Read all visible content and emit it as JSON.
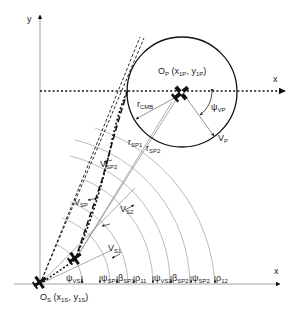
{
  "colors": {
    "background": "#ffffff",
    "axis": "#999999",
    "ink": "#111111",
    "thin_line": "#777777",
    "arc": "#aaaaaa"
  },
  "axes": {
    "y_label": "y",
    "x_label_bottom": "x",
    "x_label_top": "x"
  },
  "origin_S": {
    "main": "O",
    "main_sub": "S",
    "coords_open": " (x",
    "x_sub": "1S",
    "comma": ", y",
    "y_sub": "1S",
    "close": ")"
  },
  "origin_P": {
    "main": "O",
    "main_sub": "P",
    "coords_open": " (x",
    "x_sub": "1P",
    "comma": ", y",
    "y_sub": "1P",
    "close": ")"
  },
  "labels": {
    "r_cmb": {
      "main": "r",
      "sub": "CMB"
    },
    "r_sp1": {
      "main": "r",
      "sub": "SP1"
    },
    "r_sp2": {
      "main": "r",
      "sub": "SP2"
    },
    "psi_vp": {
      "main": "ψ",
      "sub": "VP"
    },
    "v_p": {
      "main": "V",
      "sub": "P"
    },
    "v_sp2": {
      "main": "V",
      "sub": "SP2"
    },
    "v_sp": {
      "main": "V",
      "sub": "SP"
    },
    "v_s2": {
      "main": "V",
      "sub": "S2"
    },
    "v_s1": {
      "main": "V",
      "sub": "S1"
    }
  },
  "angle_labels": [
    {
      "main": "ψ",
      "sub": "VS1"
    },
    {
      "main": "ψ",
      "sub": "SP1"
    },
    {
      "main": "β",
      "sub": "SP1"
    },
    {
      "main": "ρ",
      "sub": "11"
    },
    {
      "main": "ψ",
      "sub": "VS2"
    },
    {
      "main": "β",
      "sub": "SP2"
    },
    {
      "main": "ψ",
      "sub": "SP2"
    },
    {
      "main": "ρ",
      "sub": "12"
    }
  ]
}
